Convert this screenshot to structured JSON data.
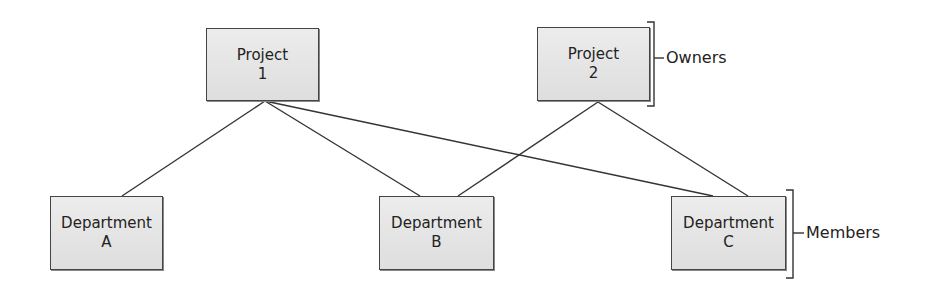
{
  "diagram": {
    "type": "bipartite-relationship",
    "owners_group_label": "Owners",
    "members_group_label": "Members",
    "owners": [
      {
        "id": "p1",
        "line1": "Project",
        "line2": "1"
      },
      {
        "id": "p2",
        "line1": "Project",
        "line2": "2"
      }
    ],
    "members": [
      {
        "id": "dA",
        "line1": "Department",
        "line2": "A"
      },
      {
        "id": "dB",
        "line1": "Department",
        "line2": "B"
      },
      {
        "id": "dC",
        "line1": "Department",
        "line2": "C"
      }
    ],
    "edges": [
      {
        "from": "Project 1",
        "to": "Department A"
      },
      {
        "from": "Project 1",
        "to": "Department B"
      },
      {
        "from": "Project 1",
        "to": "Department C"
      },
      {
        "from": "Project 2",
        "to": "Department B"
      },
      {
        "from": "Project 2",
        "to": "Department C"
      }
    ],
    "colors": {
      "box_fill": "#e4e4e4",
      "box_border": "#444444",
      "line": "#333333",
      "text": "#222222"
    }
  }
}
